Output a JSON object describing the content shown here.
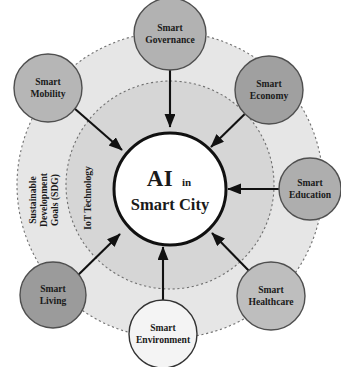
{
  "diagram": {
    "title_core_line1": "AI",
    "title_core_small": "in",
    "title_core_line2": "Smart City",
    "rings": [
      {
        "key": "sdg",
        "label_line1": "Sustainable",
        "label_line2": "Development",
        "label_line3": "Goals (SDG)",
        "fill": "#e4e4e4",
        "stroke": "#6b6b6b"
      },
      {
        "key": "iot",
        "label_line1": "IoT Technology",
        "fill": "#d3d3d3",
        "stroke": "#6b6b6b"
      }
    ],
    "core": {
      "fill": "#ffffff",
      "stroke": "#111111"
    },
    "nodes": [
      {
        "key": "smart-governance",
        "line1": "Smart",
        "line2": "Governance",
        "fill": "#b0b0b0",
        "stroke": "#555555"
      },
      {
        "key": "smart-economy",
        "line1": "Smart",
        "line2": "Economy",
        "fill": "#9e9e9e",
        "stroke": "#555555"
      },
      {
        "key": "smart-education",
        "line1": "Smart",
        "line2": "Education",
        "fill": "#adadad",
        "stroke": "#555555"
      },
      {
        "key": "smart-healthcare",
        "line1": "Smart",
        "line2": "Healthcare",
        "fill": "#bdbdbd",
        "stroke": "#555555"
      },
      {
        "key": "smart-environment",
        "line1": "Smart",
        "line2": "Environment",
        "fill": "#f2f2f2",
        "stroke": "#333333"
      },
      {
        "key": "smart-living",
        "line1": "Smart",
        "line2": "Living",
        "fill": "#9a9a9a",
        "stroke": "#555555"
      },
      {
        "key": "smart-mobility",
        "line1": "Smart",
        "line2": "Mobility",
        "fill": "#b5b5b5",
        "stroke": "#555555"
      }
    ],
    "arrow_color": "#111111",
    "background": "#ffffff"
  }
}
